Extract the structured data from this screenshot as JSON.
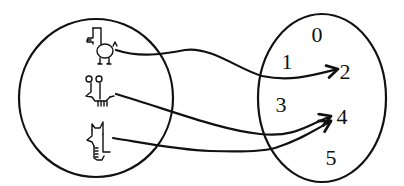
{
  "diagram": {
    "type": "function-mapping",
    "domain_set": {
      "label": "creatures",
      "elements": [
        {
          "id": "creature-1",
          "description": "bird-like doodle creature with beak and two legs"
        },
        {
          "id": "creature-2",
          "description": "mouse-like doodle creature with round ears and many legs"
        },
        {
          "id": "creature-3",
          "description": "cat-like doodle creature with pointed ears"
        }
      ]
    },
    "codomain_set": {
      "label": "numbers",
      "elements": [
        "0",
        "1",
        "2",
        "3",
        "4",
        "5"
      ]
    },
    "mappings": [
      {
        "from": "creature-1",
        "to": "2"
      },
      {
        "from": "creature-2",
        "to": "4"
      },
      {
        "from": "creature-3",
        "to": "4"
      }
    ],
    "stroke_color": "#111111",
    "background_color": "#ffffff"
  }
}
